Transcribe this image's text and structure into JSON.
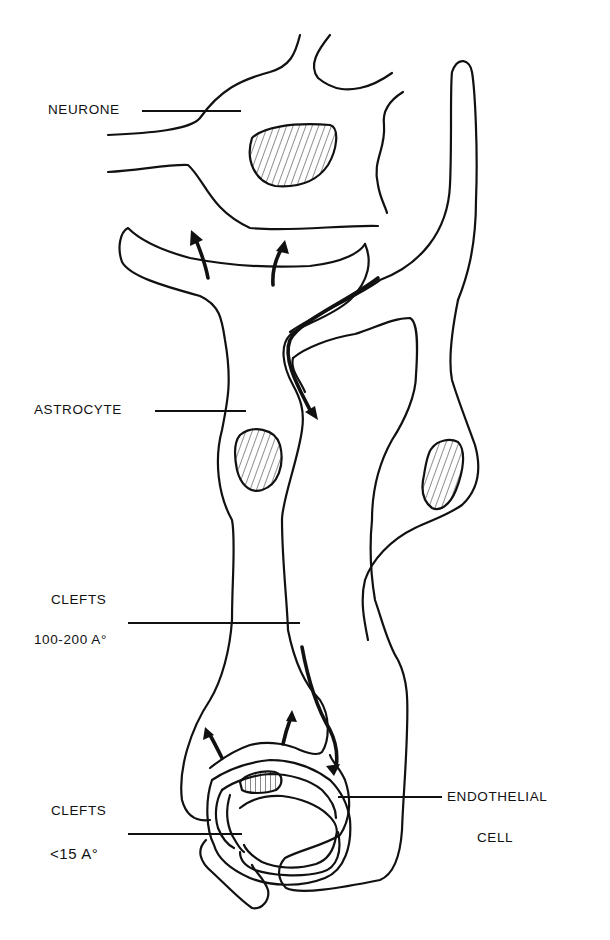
{
  "diagram": {
    "type": "biological schematic",
    "labels": {
      "neurone": "NEURONE",
      "astrocyte": "ASTROCYTE",
      "clefts_wide_title": "CLEFTS",
      "clefts_wide_size": "100-200 A°",
      "clefts_narrow_title": "CLEFTS",
      "clefts_narrow_size": "<15 A°",
      "endothelial_line1": "ENDOTHELIAL",
      "endothelial_line2": "CELL"
    },
    "structures": [
      {
        "name": "neurone",
        "has_nucleus": true
      },
      {
        "name": "astrocyte-left",
        "has_nucleus": true
      },
      {
        "name": "astrocyte-right",
        "has_nucleus": true
      },
      {
        "name": "endothelial-cell",
        "has_nucleus": true
      },
      {
        "name": "capillary-lumen"
      }
    ],
    "arrows": [
      {
        "name": "arrow-to-neurone-1",
        "direction": "up"
      },
      {
        "name": "arrow-to-neurone-2",
        "direction": "up"
      },
      {
        "name": "arrow-cleft-flow-top",
        "direction": "down"
      },
      {
        "name": "arrow-cleft-flow-bottom",
        "direction": "down"
      },
      {
        "name": "arrow-from-capillary-1",
        "direction": "up-left"
      },
      {
        "name": "arrow-from-capillary-2",
        "direction": "up"
      }
    ],
    "colors": {
      "ink": "#111111",
      "background": "#ffffff"
    }
  }
}
